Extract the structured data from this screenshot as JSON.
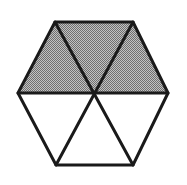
{
  "figure": {
    "name": "shaded-hexagon-diagram",
    "title": "Regular hexagon divided into six congruent triangles",
    "background_color": "#ffffff",
    "shape": "hexagon",
    "orientation": "flat-top",
    "total_parts": 6,
    "shaded_parts": 3,
    "unshaded_parts": 3,
    "fraction_shaded": "3/6",
    "fraction_simplified": "1/2",
    "percent_shaded": "50%"
  },
  "style": {
    "line_color": "#1a1a1a",
    "line_width": 3,
    "shaded_fill": "#9a9a9a",
    "shaded_pattern": "checkerboard-dither-50",
    "dither_dot_color": "#6f6f6f",
    "dither_gap_color": "#c2c2c2",
    "unshaded_fill": "#ffffff"
  },
  "geometry": {
    "center": {
      "x": 93,
      "y": 93
    },
    "vertices": [
      {
        "id": "left",
        "label": "A",
        "x": 18,
        "y": 93
      },
      {
        "id": "top-left",
        "label": "B",
        "x": 55,
        "y": 22
      },
      {
        "id": "top-right",
        "label": "C",
        "x": 133,
        "y": 22
      },
      {
        "id": "right",
        "label": "D",
        "x": 168,
        "y": 93
      },
      {
        "id": "bottom-right",
        "label": "E",
        "x": 133,
        "y": 165
      },
      {
        "id": "bottom-left",
        "label": "F",
        "x": 56,
        "y": 165
      }
    ],
    "hex_path": "M 18,93 L 55,22 L 133,22 L 168,93 L 133,165 L 56,165 Z",
    "sectors": [
      {
        "id": "upper-left",
        "shaded": true,
        "points": "18,93 55,22 93,93",
        "position": "upper-left"
      },
      {
        "id": "upper-middle",
        "shaded": true,
        "points": "55,22 133,22 93,93",
        "position": "upper-middle"
      },
      {
        "id": "upper-right",
        "shaded": true,
        "points": "133,22 168,93 93,93",
        "position": "upper-right"
      },
      {
        "id": "lower-right",
        "shaded": false,
        "points": "168,93 133,165 93,93",
        "position": "lower-right"
      },
      {
        "id": "lower-middle",
        "shaded": false,
        "points": "133,165 56,165 93,93",
        "position": "lower-middle"
      },
      {
        "id": "lower-left",
        "shaded": false,
        "points": "56,165 18,93 93,93",
        "position": "lower-left"
      }
    ],
    "diagonals": [
      {
        "id": "diagonal-horizontal",
        "from": "left",
        "to": "right",
        "x1": 18,
        "y1": 93,
        "x2": 168,
        "y2": 93
      },
      {
        "id": "diagonal-top-left-to-bottom-right",
        "from": "top-left",
        "to": "bottom-right",
        "x1": 55,
        "y1": 22,
        "x2": 133,
        "y2": 165
      },
      {
        "id": "diagonal-top-right-to-bottom-left",
        "from": "top-right",
        "to": "bottom-left",
        "x1": 133,
        "y1": 22,
        "x2": 56,
        "y2": 165
      }
    ]
  }
}
